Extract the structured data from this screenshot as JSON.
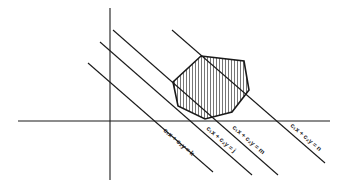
{
  "diagram": {
    "type": "linear-programming-feasible-region",
    "axes": {
      "x_axis": {
        "x1": 18,
        "y1": 121,
        "x2": 330,
        "y2": 121
      },
      "y_axis": {
        "x1": 110,
        "y1": 8,
        "x2": 110,
        "y2": 180
      }
    },
    "feasible_region": {
      "label": "feasible region",
      "hatched": true,
      "points": "201,56 244,61 249,90 232,112 205,119 178,106 173,82"
    },
    "iso_lines": [
      {
        "id": "k",
        "label": "c₁x + c₂y = k",
        "x1": 88,
        "y1": 63,
        "x2": 213,
        "y2": 172,
        "lx": 163,
        "ly": 131
      },
      {
        "id": "j",
        "label": "c₁x + c₂y = j",
        "x1": 100,
        "y1": 42,
        "x2": 252,
        "y2": 175,
        "lx": 206,
        "ly": 129
      },
      {
        "id": "m",
        "label": "c₁x + c₂y = m",
        "x1": 113,
        "y1": 30,
        "x2": 278,
        "y2": 175,
        "lx": 232,
        "ly": 128
      },
      {
        "id": "n",
        "label": "c₁x + c₂y = n",
        "x1": 172,
        "y1": 30,
        "x2": 325,
        "y2": 163,
        "lx": 290,
        "ly": 126
      }
    ],
    "label_angle_deg": 41,
    "colors": {
      "stroke": "#1a1a1a",
      "background": "#ffffff"
    }
  }
}
